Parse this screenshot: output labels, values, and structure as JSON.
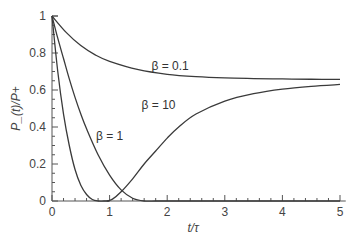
{
  "chart_data": {
    "type": "line",
    "title": "",
    "xlabel": "t/τ",
    "ylabel": "P_(t)/P+",
    "xlim": [
      0,
      5.1
    ],
    "ylim": [
      0,
      1
    ],
    "grid": false,
    "legend": "inline labels",
    "x_ticks": [
      "0",
      "1",
      "2",
      "3",
      "4",
      "5"
    ],
    "y_ticks": [
      "0",
      "0.2",
      "0.4",
      "0.6",
      "0.8",
      "1"
    ],
    "series": [
      {
        "name": "β = 0.1",
        "label_pos": [
          2.05,
          0.71
        ],
        "x": [
          0,
          0.25,
          0.5,
          0.75,
          1,
          1.5,
          2,
          2.5,
          3,
          3.5,
          4,
          4.5,
          5
        ],
        "y": [
          1,
          0.91,
          0.84,
          0.79,
          0.755,
          0.71,
          0.685,
          0.672,
          0.665,
          0.662,
          0.66,
          0.658,
          0.657
        ]
      },
      {
        "name": "β = 1",
        "label_pos": [
          1.0,
          0.33
        ],
        "x": [
          0,
          0.1,
          0.2,
          0.3,
          0.4,
          0.5,
          0.6,
          0.7,
          0.8,
          0.9,
          1.0
        ],
        "y": [
          1,
          0.7,
          0.47,
          0.3,
          0.17,
          0.085,
          0.035,
          0.008,
          0,
          0,
          0
        ]
      },
      {
        "name": "β = 10",
        "label_pos": [
          1.85,
          0.5
        ],
        "x": [
          0,
          0.1,
          0.2,
          0.3,
          0.4,
          0.5,
          0.6,
          0.8,
          1.0,
          1.2,
          1.4,
          1.6,
          1.8,
          2.0,
          2.2,
          2.5,
          3.0,
          3.5,
          4.0,
          4.5,
          5.0
        ],
        "y": [
          1,
          0.88,
          0.77,
          0.66,
          0.56,
          0.47,
          0.39,
          0.25,
          0.14,
          0.06,
          0.015,
          0,
          0,
          0,
          0,
          0,
          0,
          0,
          0,
          0,
          0
        ]
      },
      {
        "name": "β = 10 (rising)",
        "x": [
          0.95,
          1.05,
          1.2,
          1.4,
          1.6,
          1.8,
          2.0,
          2.2,
          2.5,
          3.0,
          3.5,
          4.0,
          4.5,
          5.0
        ],
        "y": [
          0,
          0.01,
          0.05,
          0.12,
          0.2,
          0.27,
          0.34,
          0.4,
          0.47,
          0.54,
          0.58,
          0.605,
          0.62,
          0.63
        ]
      }
    ]
  },
  "labels": {
    "beta_01": "β = 0.1",
    "beta_1": "β = 1",
    "beta_10": "β = 10",
    "xlabel": "t/τ",
    "ylabel": "P_(t)/P+"
  }
}
